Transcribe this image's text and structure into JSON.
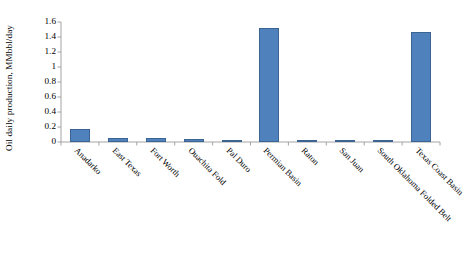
{
  "chart_data": {
    "type": "bar",
    "title": "",
    "xlabel": "",
    "ylabel": "Oil daily production, MMbbl/day",
    "ylim": [
      0,
      1.6
    ],
    "ytick_labels": [
      "1.6",
      "1.4",
      "1.2",
      "1",
      "0.8",
      "0.6",
      "0.4",
      "0.2",
      "0"
    ],
    "ytick_values": [
      1.6,
      1.4,
      1.2,
      1.0,
      0.8,
      0.6,
      0.4,
      0.2,
      0
    ],
    "grid": false,
    "legend": "none",
    "bar_color": "#4f81bd",
    "bar_border_color": "#3c6493",
    "categories": [
      "Anadarko",
      "East Texas",
      "Fort Worth",
      "Ouachita Fold",
      "Pal Duro",
      "Permian Basin",
      "Raton",
      "San Juan",
      "South Oklahoma Folded Belt",
      "Texas Coast Basin"
    ],
    "values": [
      0.17,
      0.06,
      0.055,
      0.035,
      0.012,
      1.52,
      0.003,
      0.015,
      0.004,
      1.47
    ]
  }
}
